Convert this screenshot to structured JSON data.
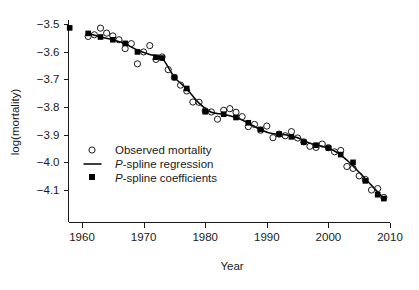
{
  "chart_data": {
    "type": "scatter",
    "title": "",
    "xlabel": "Year",
    "ylabel": "log(mortality)",
    "xlim": [
      1957.5,
      2010.5
    ],
    "ylim": [
      -4.16,
      -3.47
    ],
    "xticks": [
      1960,
      1970,
      1980,
      1990,
      2000,
      2010
    ],
    "yticks": [
      -3.5,
      -3.6,
      -3.7,
      -3.8,
      -3.9,
      -4.0,
      -4.1
    ],
    "xtick_labels": [
      "1960",
      "1970",
      "1980",
      "1990",
      "2000",
      "2010"
    ],
    "ytick_labels": [
      "-3.5",
      "-3.6",
      "-3.7",
      "-3.8",
      "-3.9",
      "-4.0",
      "-4.1"
    ],
    "grid": false,
    "legend_position": "lower-left-inside",
    "series": [
      {
        "name": "Observed mortality",
        "marker": "open-circle",
        "x": [
          1961,
          1962,
          1963,
          1964,
          1965,
          1966,
          1967,
          1968,
          1969,
          1970,
          1971,
          1972,
          1973,
          1974,
          1975,
          1976,
          1977,
          1978,
          1979,
          1980,
          1981,
          1982,
          1983,
          1984,
          1985,
          1986,
          1987,
          1988,
          1989,
          1990,
          1991,
          1992,
          1993,
          1994,
          1995,
          1996,
          1997,
          1998,
          1999,
          2000,
          2001,
          2002,
          2003,
          2004,
          2005,
          2006,
          2007,
          2008,
          2009
        ],
        "y": [
          -3.545,
          -3.539,
          -3.515,
          -3.533,
          -3.543,
          -3.557,
          -3.589,
          -3.571,
          -3.644,
          -3.601,
          -3.578,
          -3.628,
          -3.619,
          -3.665,
          -3.693,
          -3.721,
          -3.742,
          -3.782,
          -3.783,
          -3.814,
          -3.818,
          -3.844,
          -3.812,
          -3.806,
          -3.819,
          -3.835,
          -3.871,
          -3.863,
          -3.884,
          -3.869,
          -3.911,
          -3.898,
          -3.904,
          -3.889,
          -3.912,
          -3.926,
          -3.942,
          -3.946,
          -3.934,
          -3.947,
          -3.962,
          -3.957,
          -4.015,
          -4.022,
          -4.049,
          -4.062,
          -4.1,
          -4.095,
          -4.127
        ],
        "count": 49
      },
      {
        "name": "P-spline coefficients",
        "marker": "filled-square",
        "x": [
          1958,
          1961,
          1963,
          1965,
          1967,
          1969,
          1972,
          1973,
          1975,
          1977,
          1980,
          1983,
          1985,
          1987,
          1989,
          1992,
          1994,
          1996,
          1998,
          2000,
          2002,
          2004,
          2006,
          2008,
          2009
        ],
        "y": [
          -3.514,
          -3.534,
          -3.547,
          -3.557,
          -3.57,
          -3.601,
          -3.62,
          -3.623,
          -3.693,
          -3.733,
          -3.817,
          -3.826,
          -3.838,
          -3.857,
          -3.881,
          -3.898,
          -3.908,
          -3.927,
          -3.938,
          -3.948,
          -3.972,
          -4.0,
          -4.067,
          -4.117,
          -4.131
        ],
        "count": 25
      },
      {
        "name": "P-spline regression",
        "marker": "line",
        "x": [
          1961,
          1963,
          1965,
          1967,
          1969,
          1971,
          1973,
          1975,
          1977,
          1979,
          1981,
          1983,
          1985,
          1987,
          1989,
          1991,
          1993,
          1995,
          1997,
          1999,
          2001,
          2003,
          2005,
          2007,
          2009
        ],
        "y": [
          -3.534,
          -3.547,
          -3.557,
          -3.572,
          -3.594,
          -3.61,
          -3.624,
          -3.692,
          -3.735,
          -3.786,
          -3.819,
          -3.826,
          -3.838,
          -3.858,
          -3.882,
          -3.897,
          -3.9,
          -3.911,
          -3.931,
          -3.942,
          -3.959,
          -3.992,
          -4.036,
          -4.083,
          -4.131
        ],
        "count": 25
      }
    ]
  },
  "legend": {
    "items": [
      {
        "label": "Observed mortality",
        "marker": "open-circle",
        "italic_prefix": ""
      },
      {
        "label": "-spline regression",
        "marker": "line",
        "italic_prefix": "P"
      },
      {
        "label": "-spline coefficients",
        "marker": "filled-square",
        "italic_prefix": "P"
      }
    ]
  },
  "colors": {
    "ink": "#1a1a1a",
    "curve": "#000000",
    "marker_fill": "#000000",
    "background": "#ffffff"
  }
}
